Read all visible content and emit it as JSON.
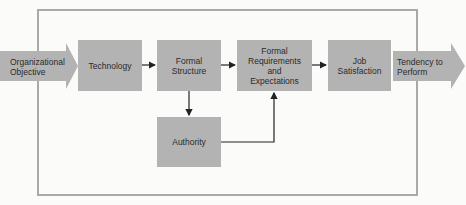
{
  "diagram": {
    "input": {
      "label": "Organizational\nObjective"
    },
    "output": {
      "label": "Tendency to\nPerform"
    },
    "nodes": [
      {
        "id": "technology",
        "label": "Technology"
      },
      {
        "id": "formal_structure",
        "label": "Formal\nStructure"
      },
      {
        "id": "formal_requirements",
        "label": "Formal\nRequirements\nand\nExpectations"
      },
      {
        "id": "job_satisfaction",
        "label": "Job\nSatisfaction"
      },
      {
        "id": "authority",
        "label": "Authority"
      }
    ],
    "edges": [
      {
        "from": "organizational_objective",
        "to": "technology"
      },
      {
        "from": "technology",
        "to": "formal_structure"
      },
      {
        "from": "formal_structure",
        "to": "formal_requirements"
      },
      {
        "from": "formal_requirements",
        "to": "job_satisfaction"
      },
      {
        "from": "job_satisfaction",
        "to": "tendency_to_perform"
      },
      {
        "from": "formal_structure",
        "to": "authority"
      },
      {
        "from": "authority",
        "to": "formal_requirements"
      }
    ],
    "colors": {
      "box_fill": "#b3b3b3",
      "frame": "#a9a9a9",
      "line": "#222222",
      "background": "#fbfbfa"
    }
  }
}
